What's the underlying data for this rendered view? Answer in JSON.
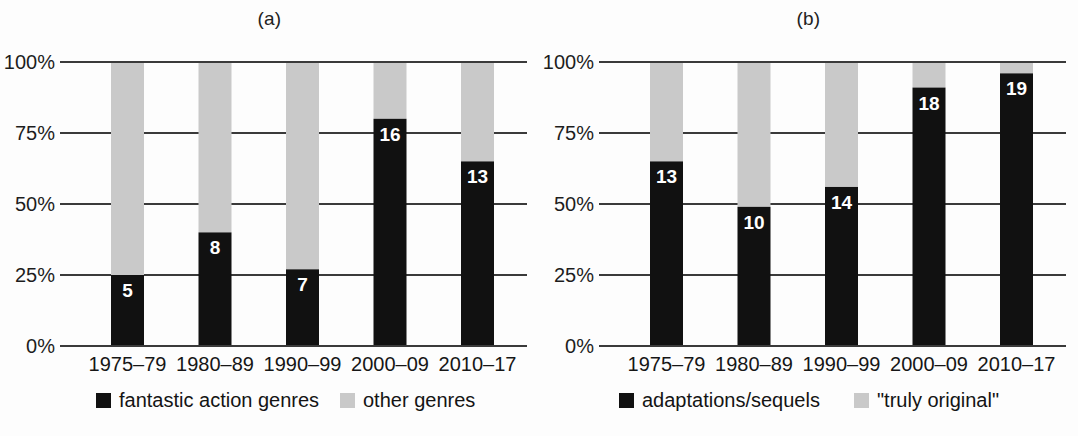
{
  "figure": {
    "background_color": "#fdfdfd",
    "dark_color": "#111111",
    "light_color": "#c9c9c9",
    "axis_color": "#3a3a3a",
    "label_color": "#1a1a1a"
  },
  "chart_data": [
    {
      "type": "bar",
      "stacked": true,
      "normalized": true,
      "panel": "(a)",
      "title": "(a)",
      "xlabel": "",
      "ylabel": "",
      "ylim": [
        0,
        100
      ],
      "yticks": [
        0,
        25,
        50,
        75,
        100
      ],
      "ytick_labels": [
        "0%",
        "25%",
        "50%",
        "75%",
        "100%"
      ],
      "grid": true,
      "legend_position": "bottom",
      "categories": [
        "1975–79",
        "1980–89",
        "1990–99",
        "2000–09",
        "2010–17"
      ],
      "series": [
        {
          "name": "fantastic action genres",
          "color": "#111111",
          "counts": [
            5,
            8,
            7,
            16,
            13
          ],
          "values": [
            25,
            40,
            27,
            80,
            65
          ],
          "labels": [
            "5",
            "8",
            "7",
            "16",
            "13"
          ]
        },
        {
          "name": "other genres",
          "color": "#c9c9c9",
          "counts": [
            null,
            null,
            null,
            null,
            null
          ],
          "values": [
            75,
            60,
            73,
            20,
            35
          ],
          "labels": [
            "",
            "",
            "",
            "",
            ""
          ]
        }
      ]
    },
    {
      "type": "bar",
      "stacked": true,
      "normalized": true,
      "panel": "(b)",
      "title": "(b)",
      "xlabel": "",
      "ylabel": "",
      "ylim": [
        0,
        100
      ],
      "yticks": [
        0,
        25,
        50,
        75,
        100
      ],
      "ytick_labels": [
        "0%",
        "25%",
        "50%",
        "75%",
        "100%"
      ],
      "grid": true,
      "legend_position": "bottom",
      "categories": [
        "1975–79",
        "1980–89",
        "1990–99",
        "2000–09",
        "2010–17"
      ],
      "series": [
        {
          "name": "adaptations/sequels",
          "color": "#111111",
          "counts": [
            13,
            10,
            14,
            18,
            19
          ],
          "values": [
            65,
            49,
            56,
            91,
            96
          ],
          "labels": [
            "13",
            "10",
            "14",
            "18",
            "19"
          ]
        },
        {
          "name": "\"truly original\"",
          "color": "#c9c9c9",
          "counts": [
            null,
            null,
            null,
            null,
            null
          ],
          "values": [
            35,
            51,
            44,
            9,
            4
          ],
          "labels": [
            "",
            "",
            "",
            "",
            ""
          ]
        }
      ]
    }
  ],
  "panel_a": {
    "title": "(a)",
    "ytick_labels": [
      "100%",
      "75%",
      "50%",
      "25%",
      "0%"
    ],
    "categories": [
      "1975–79",
      "1980–89",
      "1990–99",
      "2000–09",
      "2010–17"
    ],
    "bar_labels": [
      "5",
      "8",
      "7",
      "16",
      "13"
    ],
    "legend": [
      {
        "label": "fantastic action genres",
        "color": "#111111"
      },
      {
        "label": "other genres",
        "color": "#c9c9c9"
      }
    ]
  },
  "panel_b": {
    "title": "(b)",
    "ytick_labels": [
      "100%",
      "75%",
      "50%",
      "25%",
      "0%"
    ],
    "categories": [
      "1975–79",
      "1980–89",
      "1990–99",
      "2000–09",
      "2010–17"
    ],
    "bar_labels": [
      "13",
      "10",
      "14",
      "18",
      "19"
    ],
    "legend": [
      {
        "label": "adaptations/sequels",
        "color": "#111111"
      },
      {
        "label": "\"truly original\"",
        "color": "#c9c9c9"
      }
    ]
  }
}
